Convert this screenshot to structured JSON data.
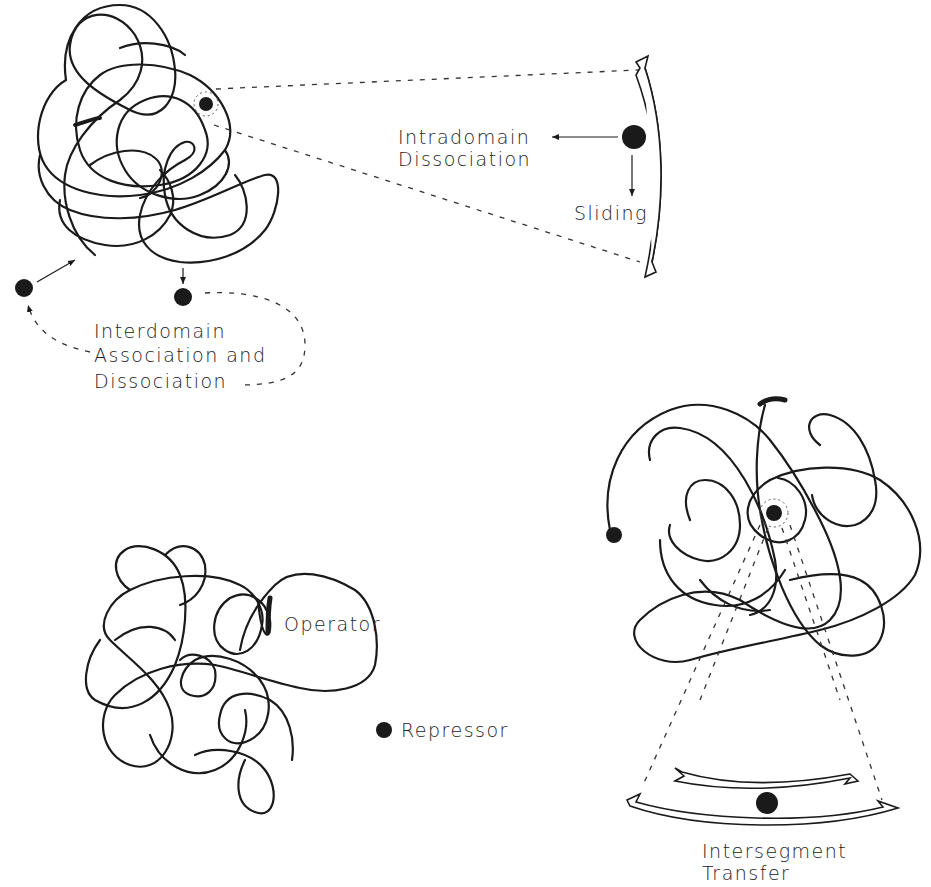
{
  "diagram": {
    "panels": {
      "top_left": {
        "name": "DNA domain with dissociation/association mechanisms",
        "labels": {
          "intradomain_line1": "Intradomain",
          "intradomain_line2": "Dissociation",
          "sliding": "Sliding",
          "interdomain_line1": "Interdomain",
          "interdomain_line2": "Association and",
          "interdomain_line3": "Dissociation"
        }
      },
      "bottom_left": {
        "name": "DNA with operator and free repressor",
        "labels": {
          "operator": "Operator",
          "repressor": "Repressor"
        }
      },
      "bottom_right": {
        "name": "Intersegment transfer",
        "labels": {
          "intersegment_line1": "Intersegment",
          "intersegment_line2": "Transfer"
        }
      }
    },
    "colors": {
      "ink": "#1a1a1a",
      "background": "#ffffff"
    }
  }
}
